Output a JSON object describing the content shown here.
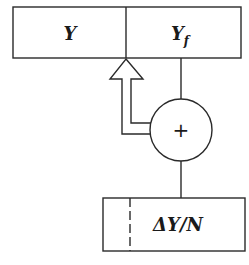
{
  "diagram": {
    "top_register": {
      "left_cell": {
        "label": "Y"
      },
      "right_cell": {
        "label": "Y",
        "subscript": "f"
      }
    },
    "adder": {
      "symbol": "+"
    },
    "bottom_register": {
      "label": "ΔY/N"
    },
    "colors": {
      "stroke": "#2a2a2a",
      "background": "#ffffff"
    }
  }
}
